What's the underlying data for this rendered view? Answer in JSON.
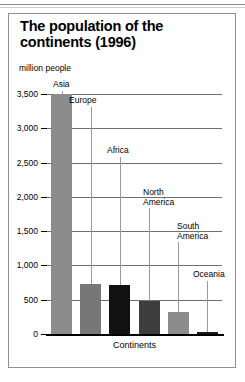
{
  "figure": {
    "title": "The population of the continents (1996)",
    "unit_label": "million\npeople",
    "xlabel": "Continents"
  },
  "chart_data": {
    "type": "bar",
    "title": "The population of the continents (1996)",
    "xlabel": "Continents",
    "ylabel": "million people",
    "ylim": [
      0,
      3500
    ],
    "yticks": [
      0,
      500,
      1000,
      1500,
      2000,
      2500,
      3000,
      3500
    ],
    "ytick_labels": [
      "0",
      "500",
      "1,000",
      "1,500",
      "2,000",
      "2,500",
      "3,000",
      "3,500"
    ],
    "grid": true,
    "legend": "none",
    "categories": [
      "Asia",
      "Europe",
      "Africa",
      "North America",
      "South America",
      "Oceania"
    ],
    "values": [
      3500,
      730,
      720,
      480,
      320,
      30
    ],
    "colors": [
      "#8c8c8c",
      "#777777",
      "#111111",
      "#3d3d3d",
      "#8c8c8c",
      "#1a1a1a"
    ],
    "labels": [
      {
        "name": "Asia",
        "text": "Asia"
      },
      {
        "name": "Europe",
        "text": "Europe"
      },
      {
        "name": "Africa",
        "text": "Africa"
      },
      {
        "name": "North America",
        "text": "North\nAmerica"
      },
      {
        "name": "South America",
        "text": "South\nAmerica"
      },
      {
        "name": "Oceania",
        "text": "Oceania"
      }
    ]
  }
}
